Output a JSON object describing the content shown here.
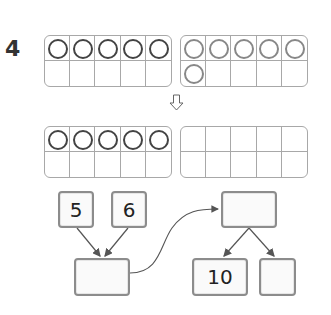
{
  "problem": {
    "number": "4"
  },
  "colors": {
    "frame_border": "#a8a8a8",
    "counter_dark": "#444444",
    "counter_light": "#888888",
    "box_border": "#8c8c8c",
    "line": "#555555"
  },
  "ten_frames": {
    "top_left": {
      "counters": 5,
      "cells": [
        1,
        1,
        1,
        1,
        1,
        0,
        0,
        0,
        0,
        0
      ]
    },
    "top_right": {
      "counters": 6,
      "cells": [
        1,
        1,
        1,
        1,
        1,
        1,
        0,
        0,
        0,
        0
      ]
    },
    "bottom_left": {
      "counters": 5,
      "cells": [
        1,
        1,
        1,
        1,
        1,
        0,
        0,
        0,
        0,
        0
      ]
    },
    "bottom_right": {
      "counters": 0,
      "cells": [
        0,
        0,
        0,
        0,
        0,
        0,
        0,
        0,
        0,
        0
      ]
    }
  },
  "down_arrow": {
    "icon": "down-arrow-icon"
  },
  "number_bond": {
    "left_part_a": "5",
    "left_part_b": "6",
    "left_total": "",
    "right_total": "",
    "right_part_a": "10",
    "right_part_b": ""
  }
}
